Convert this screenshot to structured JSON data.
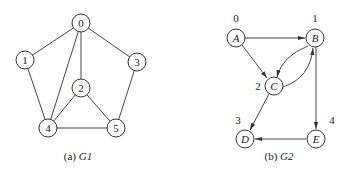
{
  "g1": {
    "caption_prefix": "(a) ",
    "caption_name": "G1",
    "nodes": [
      {
        "id": "0",
        "label": "0",
        "x": 81,
        "y": 23
      },
      {
        "id": "1",
        "label": "1",
        "x": 25,
        "y": 60
      },
      {
        "id": "2",
        "label": "2",
        "x": 81,
        "y": 88
      },
      {
        "id": "3",
        "label": "3",
        "x": 137,
        "y": 62
      },
      {
        "id": "4",
        "label": "4",
        "x": 48,
        "y": 128
      },
      {
        "id": "5",
        "label": "5",
        "x": 116,
        "y": 128
      }
    ],
    "edges": [
      [
        "0",
        "1"
      ],
      [
        "0",
        "3"
      ],
      [
        "0",
        "2"
      ],
      [
        "0",
        "4"
      ],
      [
        "1",
        "4"
      ],
      [
        "2",
        "4"
      ],
      [
        "2",
        "5"
      ],
      [
        "3",
        "5"
      ],
      [
        "4",
        "5"
      ]
    ]
  },
  "g2": {
    "caption_prefix": "(b) ",
    "caption_name": "G2",
    "nodes": [
      {
        "id": "A",
        "label": "A",
        "index": "0",
        "x": 236,
        "y": 38
      },
      {
        "id": "B",
        "label": "B",
        "index": "1",
        "x": 315,
        "y": 38
      },
      {
        "id": "C",
        "label": "C",
        "index": "2",
        "x": 274,
        "y": 86
      },
      {
        "id": "D",
        "label": "D",
        "index": "3",
        "x": 245,
        "y": 139
      },
      {
        "id": "E",
        "label": "E",
        "index": "4",
        "x": 316,
        "y": 139
      }
    ],
    "edges": [
      [
        "A",
        "B"
      ],
      [
        "A",
        "C"
      ],
      [
        "B",
        "C"
      ],
      [
        "C",
        "B"
      ],
      [
        "B",
        "E"
      ],
      [
        "C",
        "D"
      ],
      [
        "E",
        "D"
      ]
    ]
  }
}
